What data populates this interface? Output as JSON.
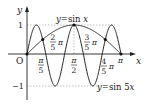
{
  "figure": {
    "type": "function-graph",
    "colors": {
      "curve": "#222222",
      "axis": "#222222",
      "guide": "#999999",
      "background": "#ffffff"
    },
    "axes": {
      "x_label": "x",
      "y_label": "y",
      "origin_label": "O"
    },
    "y_ticks": [
      {
        "value": 1,
        "label": "1"
      },
      {
        "value": -1,
        "label": "−1"
      }
    ],
    "x_ticks_below": [
      {
        "label_num": "π",
        "label_den": "5",
        "value": "pi/5"
      },
      {
        "label_num": "π",
        "label_den": "2",
        "value": "pi/2"
      }
    ],
    "x_ticks_above": [
      {
        "label_num": "2",
        "label_den": "5",
        "suffix": "π",
        "value": "2pi/5"
      },
      {
        "label_num": "3",
        "label_den": "5",
        "suffix": "π",
        "value": "3pi/5"
      }
    ],
    "x_tick_right": {
      "label_num": "4",
      "label_den": "5",
      "suffix": "π",
      "value": "4pi/5"
    },
    "pi_label": "π",
    "curves": [
      {
        "name": "sin x",
        "label": "y=sin x",
        "expression": "y = sin x",
        "domain": "[0, pi]"
      },
      {
        "name": "sin 5x",
        "label": "y=sin 5x",
        "expression": "y = sin 5x",
        "domain": "[0, pi]"
      }
    ],
    "labels": {
      "sinx_prefix": "y",
      "sinx_rest": "=sin ",
      "sinx_var": "x",
      "sin5x_prefix": "y",
      "sin5x_rest": "=sin 5",
      "sin5x_var": "x"
    },
    "intersection_points": [
      {
        "x": "0",
        "y": "0"
      },
      {
        "x": "pi/6",
        "y": "1/2"
      },
      {
        "x": "pi/2",
        "y": "1"
      },
      {
        "x": "5pi/6",
        "y": "1/2"
      },
      {
        "x": "pi",
        "y": "0"
      }
    ]
  }
}
